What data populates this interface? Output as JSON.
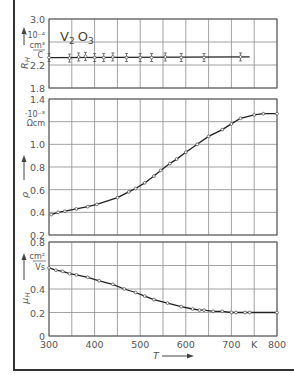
{
  "chart_data": [
    {
      "type": "line",
      "title": "V2O3",
      "ylabel": "R_H",
      "yunit": "10^-4 cm^3/C",
      "ylim": [
        1.8,
        3.0
      ],
      "yticks": [
        1.8,
        2.2,
        3.0
      ],
      "xlim": [
        300,
        800
      ],
      "x": [
        300,
        345,
        365,
        380,
        400,
        420,
        440,
        470,
        500,
        525,
        555,
        590,
        640,
        720
      ],
      "values": [
        2.33,
        2.32,
        2.34,
        2.35,
        2.33,
        2.33,
        2.34,
        2.33,
        2.33,
        2.33,
        2.34,
        2.33,
        2.33,
        2.34
      ],
      "fit_line": {
        "x": [
          300,
          740
        ],
        "y": [
          2.33,
          2.34
        ]
      },
      "error_bars": true
    },
    {
      "type": "line",
      "ylabel": "ρ",
      "yunit": "10^-3 Ωcm",
      "ylim": [
        0.2,
        1.4
      ],
      "yticks": [
        0.2,
        0.4,
        0.6,
        0.8,
        1.0,
        1.4
      ],
      "xlim": [
        300,
        800
      ],
      "x": [
        305,
        320,
        335,
        360,
        385,
        405,
        450,
        475,
        490,
        510,
        530,
        545,
        565,
        580,
        600,
        625,
        650,
        680,
        700,
        720,
        750,
        770,
        800
      ],
      "values": [
        0.38,
        0.4,
        0.41,
        0.43,
        0.45,
        0.47,
        0.53,
        0.58,
        0.61,
        0.66,
        0.72,
        0.77,
        0.83,
        0.87,
        0.93,
        1.0,
        1.07,
        1.13,
        1.18,
        1.23,
        1.26,
        1.27,
        1.27
      ]
    },
    {
      "type": "line",
      "ylabel": "μ_H",
      "yunit": "cm^2/Vs",
      "xlabel": "T",
      "xunit": "K",
      "ylim": [
        0,
        0.8
      ],
      "yticks": [
        0,
        0.2,
        0.4,
        0.8
      ],
      "xticks": [
        300,
        400,
        500,
        600,
        700,
        800
      ],
      "xlim": [
        300,
        800
      ],
      "x": [
        300,
        315,
        330,
        345,
        360,
        385,
        410,
        440,
        465,
        490,
        510,
        530,
        560,
        590,
        615,
        630,
        640,
        660,
        680,
        700,
        710,
        730,
        740,
        800
      ],
      "values": [
        0.58,
        0.56,
        0.55,
        0.53,
        0.52,
        0.5,
        0.47,
        0.44,
        0.4,
        0.37,
        0.34,
        0.31,
        0.28,
        0.25,
        0.23,
        0.22,
        0.22,
        0.21,
        0.21,
        0.2,
        0.2,
        0.2,
        0.2,
        0.2
      ]
    }
  ],
  "labels": {
    "material": "V",
    "material_sub1": "2",
    "material_mid": "O",
    "material_sub2": "3",
    "top_unit_exp": "·10⁻⁴",
    "top_unit_num": "cm³",
    "top_unit_den": "C",
    "top_ylabel": "R",
    "top_ylabel_sub": "H",
    "mid_unit_exp": "·10⁻³",
    "mid_unit": "Ωcm",
    "mid_ylabel": "ρ",
    "bot_unit_num": "cm²",
    "bot_unit_den": "Vs",
    "bot_ylabel": "μ",
    "bot_ylabel_sub": "H",
    "xlabel": "T",
    "xunit": "K"
  }
}
